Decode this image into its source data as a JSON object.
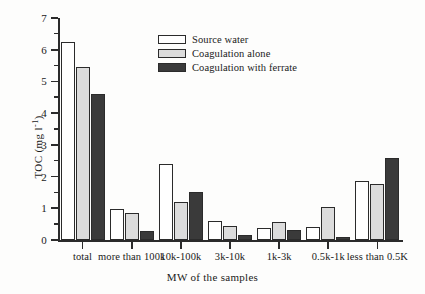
{
  "chart_data": {
    "type": "bar",
    "title": "",
    "xlabel": "MW of the samples",
    "ylabel": "TOC (mg l-1)",
    "ylabel_base": "TOC (mg l",
    "ylabel_exponent": "-1",
    "ylabel_tail": ")",
    "ylim": [
      0,
      7
    ],
    "ytick_step_major": 1,
    "ytick_step_minor": 0.5,
    "grid": false,
    "legend_position": "upper-center",
    "categories": [
      "total",
      "more than 100k",
      "10k-100k",
      "3k-10k",
      "1k-3k",
      "0.5k-1k",
      "less than 0.5K"
    ],
    "yticks": [
      "0",
      "1",
      "2",
      "3",
      "4",
      "5",
      "6",
      "7"
    ],
    "series": [
      {
        "name": "Source water",
        "color": "#ffffff",
        "values": [
          6.25,
          0.98,
          2.4,
          0.61,
          0.39,
          0.4,
          1.86
        ]
      },
      {
        "name": "Coagulation alone",
        "color": "#dcdcdc",
        "values": [
          5.45,
          0.85,
          1.19,
          0.44,
          0.56,
          1.03,
          1.76
        ]
      },
      {
        "name": "Coagulation with ferrate",
        "color": "#3a3a3a",
        "values": [
          4.6,
          0.27,
          1.5,
          0.17,
          0.31,
          0.11,
          2.58
        ]
      }
    ]
  },
  "legend": {
    "items": [
      {
        "label": "Source water",
        "swatch": "legend-swatch-source-water"
      },
      {
        "label": "Coagulation alone",
        "swatch": "legend-swatch-coagulation-alone"
      },
      {
        "label": "Coagulation with ferrate",
        "swatch": "legend-swatch-coagulation-with-ferrate"
      }
    ]
  }
}
